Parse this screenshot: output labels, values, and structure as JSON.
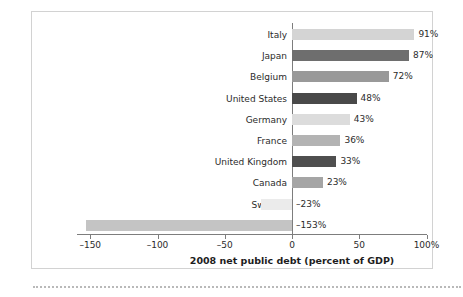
{
  "chart_data": {
    "type": "bar",
    "orientation": "horizontal",
    "title": "",
    "xlabel": "2008 net public debt (percent of GDP)",
    "ylabel": "",
    "categories": [
      "Italy",
      "Japan",
      "Belgium",
      "United States",
      "Germany",
      "France",
      "United Kingdom",
      "Canada",
      "Sweden",
      "Norway"
    ],
    "values": [
      91,
      87,
      72,
      48,
      43,
      36,
      33,
      23,
      -23,
      -153
    ],
    "value_labels": [
      "91%",
      "87%",
      "72%",
      "48%",
      "43%",
      "36%",
      "33%",
      "23%",
      "–23%",
      "–153%"
    ],
    "bar_colors": [
      "#d4d4d4",
      "#6e6e6e",
      "#999999",
      "#494949",
      "#dcdcdc",
      "#b3b3b3",
      "#4f4f4f",
      "#a5a5a5",
      "#ebebeb",
      "#c4c4c4"
    ],
    "xlim": [
      -175,
      115
    ],
    "xticks": [
      -150,
      -100,
      -50,
      0,
      50,
      100
    ],
    "xtick_labels": [
      "–150",
      "–100",
      "–50",
      "0",
      "50",
      "100%"
    ],
    "grid": false,
    "legend": null,
    "axis_color": "#7d7d7d",
    "frame_color": "#d2d2d2"
  }
}
